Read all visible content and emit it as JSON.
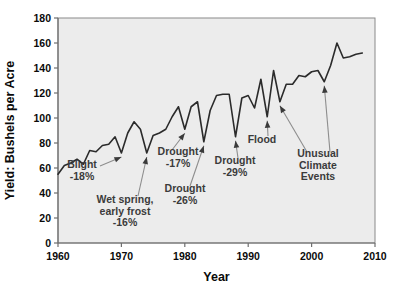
{
  "chart_data": {
    "type": "line",
    "title": "",
    "xlabel": "Year",
    "ylabel": "Yield: Bushels per Acre",
    "xlim": [
      1960,
      2010
    ],
    "ylim": [
      0,
      180
    ],
    "xticks": [
      1960,
      1970,
      1980,
      1990,
      2000,
      2010
    ],
    "yticks": [
      0,
      20,
      40,
      60,
      80,
      100,
      120,
      140,
      160,
      180
    ],
    "grid": false,
    "legend": "none",
    "series": [
      {
        "name": "Corn yield",
        "x": [
          1960,
          1961,
          1962,
          1963,
          1964,
          1965,
          1966,
          1967,
          1968,
          1969,
          1970,
          1971,
          1972,
          1973,
          1974,
          1975,
          1976,
          1977,
          1978,
          1979,
          1980,
          1981,
          1982,
          1983,
          1984,
          1985,
          1986,
          1987,
          1988,
          1989,
          1990,
          1991,
          1992,
          1993,
          1994,
          1995,
          1996,
          1997,
          1998,
          1999,
          2000,
          2001,
          2002,
          2003,
          2004,
          2005,
          2006,
          2007,
          2008
        ],
        "values": [
          55,
          62,
          64,
          67,
          63,
          74,
          73,
          78,
          79,
          85,
          72,
          88,
          97,
          91,
          72,
          86,
          88,
          91,
          101,
          109,
          91,
          109,
          113,
          81,
          106,
          118,
          119,
          119,
          85,
          116,
          118,
          108,
          131,
          101,
          138,
          113,
          127,
          127,
          134,
          133,
          137,
          138,
          129,
          142,
          160,
          148,
          149,
          151,
          152
        ]
      }
    ],
    "annotations": [
      {
        "id": "blight",
        "lines": [
          "Blight",
          "-18%"
        ],
        "percent": "-18%",
        "event": "Blight",
        "year": 1970,
        "value": 72
      },
      {
        "id": "wet-spring",
        "lines": [
          "Wet spring,",
          "early frost",
          "-16%"
        ],
        "percent": "-16%",
        "event": "Wet spring, early frost",
        "year": 1974,
        "value": 72
      },
      {
        "id": "drought-1980",
        "lines": [
          "Drought",
          "-17%"
        ],
        "percent": "-17%",
        "event": "Drought",
        "year": 1980,
        "value": 91
      },
      {
        "id": "drought-1983",
        "lines": [
          "Drought",
          "-26%"
        ],
        "percent": "-26%",
        "event": "Drought",
        "year": 1983,
        "value": 81
      },
      {
        "id": "drought-1988",
        "lines": [
          "Drought",
          "-29%"
        ],
        "percent": "-29%",
        "event": "Drought",
        "year": 1988,
        "value": 85
      },
      {
        "id": "flood",
        "lines": [
          "Flood"
        ],
        "percent": "",
        "event": "Flood",
        "year": 1993,
        "value": 101
      },
      {
        "id": "unusual-climate",
        "lines": [
          "Unusual",
          "Climate",
          "Events"
        ],
        "percent": "",
        "event": "Unusual Climate Events",
        "year": 1995,
        "value": 113
      },
      {
        "id": "unusual-climate-2",
        "lines": [],
        "percent": "",
        "event": "Unusual Climate Events",
        "year": 2002,
        "value": 129
      }
    ],
    "colors": {
      "line": "#2b2b2b",
      "plot_background": "#ececec",
      "axis": "#6f6f6f",
      "annotation_text": "#3b3b3b",
      "arrow": "#8d8d8d"
    }
  }
}
